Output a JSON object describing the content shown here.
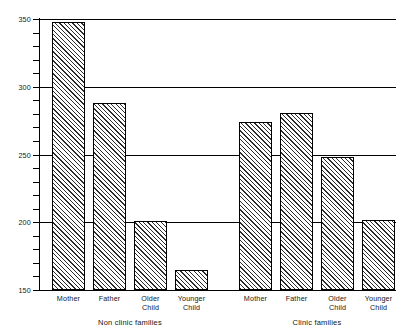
{
  "chart_data": {
    "type": "bar",
    "title": "",
    "subtitle": "",
    "xlabel": "",
    "ylabel": "",
    "ylim": [
      150,
      350
    ],
    "grid": true,
    "legend": "none",
    "y_major_ticks": [
      150,
      200,
      250,
      300,
      350
    ],
    "y_major_tick_labels": [
      "150",
      "200",
      "250",
      "300",
      "350"
    ],
    "y_minor_tick_step": 10,
    "gridlines_at": [
      200,
      250,
      300,
      350
    ],
    "categories": [
      "Mother",
      "Father",
      "Older\nChild",
      "Younger\nChild",
      "Mother",
      "Father",
      "Older\nChild",
      "Younger\nChild"
    ],
    "groups": [
      {
        "label": "Non clinic families",
        "categories": [
          "Mother",
          "Father",
          "Older\nChild",
          "Younger\nChild"
        ],
        "values": [
          348,
          288,
          201,
          165
        ]
      },
      {
        "label": "Clinic families",
        "categories": [
          "Mother",
          "Father",
          "Older\nChild",
          "Younger\nChild"
        ],
        "values": [
          274,
          281,
          248,
          202
        ]
      }
    ],
    "values": [
      348,
      288,
      201,
      165,
      274,
      281,
      248,
      202
    ],
    "bar_fill": "diagonal-hatch",
    "bar_edge_color": "#000000",
    "axis_color": "#000000"
  }
}
